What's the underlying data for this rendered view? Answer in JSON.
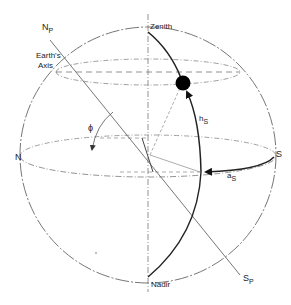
{
  "diagram": {
    "type": "celestial-sphere",
    "colors": {
      "line": "#555555",
      "thin": "#888888",
      "bold": "#222222",
      "sun": "#000000",
      "background": "#ffffff"
    },
    "labels": {
      "north_pole": {
        "main": "N",
        "sub": "P"
      },
      "earths_axis_line1": "Earth's",
      "earths_axis_line2": "Axis",
      "zenith": "Zenith",
      "nadir": "Nadir",
      "north": "N",
      "south": "S",
      "latitude": "ϕ",
      "altitude": {
        "main": "h",
        "sub": "S"
      },
      "azimuth": {
        "main": "a",
        "sub": "S"
      },
      "south_pole": {
        "main": "S",
        "sub": "P"
      }
    },
    "elements": {
      "sphere": "outer-circle",
      "horizon": "horizon-ellipse",
      "parallel": "sun-daily-path-ellipse",
      "axis": "earths-axis-line",
      "vertical": "zenith-nadir-line",
      "sun": "sun-position-dot",
      "meridian": "sun-vertical-arc",
      "azimuth_arc": "azimuth-arrow-arc",
      "latitude_arc": "latitude-arc"
    }
  }
}
